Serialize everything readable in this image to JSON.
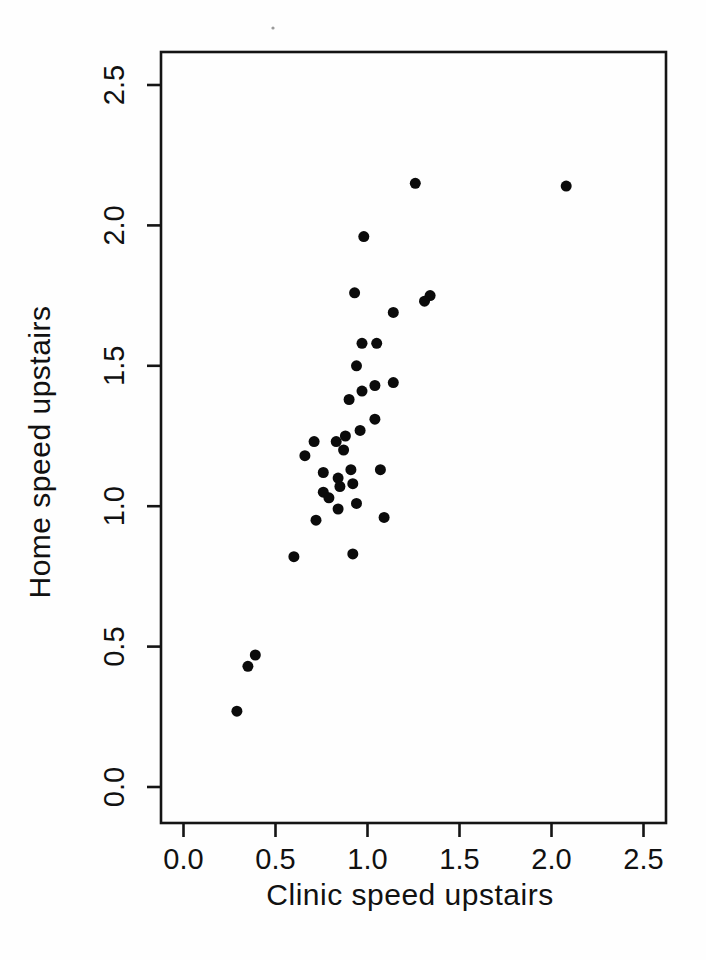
{
  "figure": {
    "kind": "scanned-scatter-plot",
    "background_color": "#fefefe",
    "ink_color": "#141414"
  },
  "chart_data": {
    "type": "scatter",
    "title": "",
    "xlabel": "Clinic speed upstairs",
    "ylabel": "Home speed upstairs",
    "xlim": [
      -0.12,
      2.62
    ],
    "ylim": [
      -0.13,
      2.62
    ],
    "x_ticks": [
      0.0,
      0.5,
      1.0,
      1.5,
      2.0,
      2.5
    ],
    "y_ticks": [
      0.0,
      0.5,
      1.0,
      1.5,
      2.0,
      2.5
    ],
    "x_tick_labels": [
      "0.0",
      "0.5",
      "1.0",
      "1.5",
      "2.0",
      "2.5"
    ],
    "y_tick_labels": [
      "0.0",
      "0.5",
      "1.0",
      "1.5",
      "2.0",
      "2.5"
    ],
    "grid": false,
    "legend": null,
    "marker": {
      "shape": "filled-circle",
      "color": "#0b0b0b",
      "radius_px": 5.5
    },
    "points": [
      [
        1.26,
        2.15
      ],
      [
        2.08,
        2.14
      ],
      [
        0.98,
        1.96
      ],
      [
        0.93,
        1.76
      ],
      [
        1.34,
        1.75
      ],
      [
        1.31,
        1.73
      ],
      [
        1.14,
        1.69
      ],
      [
        0.97,
        1.58
      ],
      [
        1.05,
        1.58
      ],
      [
        0.94,
        1.5
      ],
      [
        1.14,
        1.44
      ],
      [
        1.04,
        1.43
      ],
      [
        0.97,
        1.41
      ],
      [
        0.9,
        1.38
      ],
      [
        1.04,
        1.31
      ],
      [
        0.96,
        1.27
      ],
      [
        0.88,
        1.25
      ],
      [
        0.71,
        1.23
      ],
      [
        0.83,
        1.23
      ],
      [
        0.87,
        1.2
      ],
      [
        0.66,
        1.18
      ],
      [
        0.76,
        1.12
      ],
      [
        0.91,
        1.13
      ],
      [
        1.07,
        1.13
      ],
      [
        0.84,
        1.1
      ],
      [
        0.92,
        1.08
      ],
      [
        0.85,
        1.07
      ],
      [
        0.76,
        1.05
      ],
      [
        0.79,
        1.03
      ],
      [
        0.94,
        1.01
      ],
      [
        0.84,
        0.99
      ],
      [
        1.09,
        0.96
      ],
      [
        0.72,
        0.95
      ],
      [
        0.92,
        0.83
      ],
      [
        0.6,
        0.82
      ],
      [
        0.39,
        0.47
      ],
      [
        0.35,
        0.43
      ],
      [
        0.29,
        0.27
      ]
    ],
    "scan_artifacts": [
      {
        "x_px": 273,
        "y_px": 28,
        "radius_px": 1.6,
        "color": "#9a9a9a"
      }
    ]
  }
}
